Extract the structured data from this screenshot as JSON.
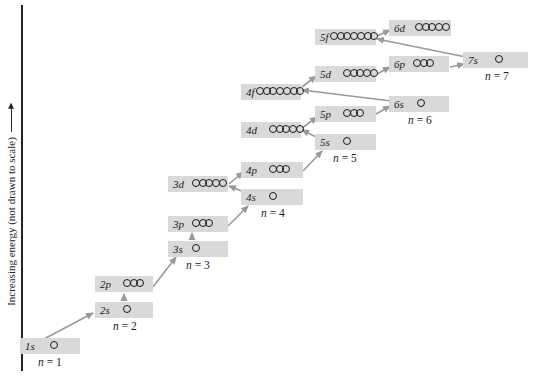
{
  "axis": {
    "label": "Increasing energy (not drawn to scale)"
  },
  "colors": {
    "box_fill": "#d9d9d9",
    "arrow": "#999999",
    "text": "#1a1a1a"
  },
  "subshells": [
    {
      "id": "1s",
      "label": "1s",
      "orbitals": 1,
      "x": 20,
      "y": 338,
      "w": 60,
      "orb_x": 30
    },
    {
      "id": "2s",
      "label": "2s",
      "orbitals": 1,
      "x": 95,
      "y": 302,
      "w": 58,
      "orb_x": 28
    },
    {
      "id": "2p",
      "label": "2p",
      "orbitals": 3,
      "x": 95,
      "y": 276,
      "w": 58,
      "orb_x": 28
    },
    {
      "id": "3s",
      "label": "3s",
      "orbitals": 1,
      "x": 168,
      "y": 241,
      "w": 60,
      "orb_x": 24
    },
    {
      "id": "3p",
      "label": "3p",
      "orbitals": 3,
      "x": 168,
      "y": 216,
      "w": 60,
      "orb_x": 24
    },
    {
      "id": "3d",
      "label": "3d",
      "orbitals": 5,
      "x": 168,
      "y": 176,
      "w": 60,
      "orb_x": 24
    },
    {
      "id": "4s",
      "label": "4s",
      "orbitals": 1,
      "x": 241,
      "y": 189,
      "w": 62,
      "orb_x": 28
    },
    {
      "id": "4p",
      "label": "4p",
      "orbitals": 3,
      "x": 241,
      "y": 162,
      "w": 62,
      "orb_x": 28
    },
    {
      "id": "4d",
      "label": "4d",
      "orbitals": 5,
      "x": 241,
      "y": 122,
      "w": 60,
      "orb_x": 28
    },
    {
      "id": "4f",
      "label": "4f",
      "orbitals": 7,
      "x": 241,
      "y": 84,
      "w": 60,
      "orb_x": 15
    },
    {
      "id": "5s",
      "label": "5s",
      "orbitals": 1,
      "x": 315,
      "y": 134,
      "w": 61,
      "orb_x": 28
    },
    {
      "id": "5p",
      "label": "5p",
      "orbitals": 3,
      "x": 315,
      "y": 106,
      "w": 61,
      "orb_x": 28
    },
    {
      "id": "5d",
      "label": "5d",
      "orbitals": 5,
      "x": 315,
      "y": 66,
      "w": 61,
      "orb_x": 28
    },
    {
      "id": "5f",
      "label": "5f",
      "orbitals": 7,
      "x": 315,
      "y": 29,
      "w": 61,
      "orb_x": 15
    },
    {
      "id": "6s",
      "label": "6s",
      "orbitals": 1,
      "x": 389,
      "y": 96,
      "w": 60,
      "orb_x": 28
    },
    {
      "id": "6p",
      "label": "6p",
      "orbitals": 3,
      "x": 389,
      "y": 56,
      "w": 60,
      "orb_x": 24
    },
    {
      "id": "6d",
      "label": "6d",
      "orbitals": 5,
      "x": 389,
      "y": 20,
      "w": 62,
      "orb_x": 26
    },
    {
      "id": "7s",
      "label": "7s",
      "orbitals": 1,
      "x": 463,
      "y": 52,
      "w": 65,
      "orb_x": 32
    }
  ],
  "shell_labels": [
    {
      "n": "n",
      "eq": " = 1",
      "x": 38,
      "y": 356
    },
    {
      "n": "n",
      "eq": " = 2",
      "x": 113,
      "y": 320
    },
    {
      "n": "n",
      "eq": " = 3",
      "x": 186,
      "y": 259
    },
    {
      "n": "n",
      "eq": " = 4",
      "x": 261,
      "y": 207
    },
    {
      "n": "n",
      "eq": " = 5",
      "x": 333,
      "y": 152
    },
    {
      "n": "n",
      "eq": " = 6",
      "x": 408,
      "y": 114
    },
    {
      "n": "n",
      "eq": " = 7",
      "x": 485,
      "y": 70
    }
  ],
  "filling_order": [
    "1s",
    "2s",
    "2p",
    "3s",
    "3p",
    "4s",
    "3d",
    "4p",
    "5s",
    "4d",
    "5p",
    "6s",
    "4f",
    "5d",
    "6p",
    "7s",
    "5f",
    "6d"
  ],
  "arrows": [
    {
      "from": "1s",
      "to": "2s",
      "x1": 44,
      "y1": 339,
      "x2": 93,
      "y2": 313
    },
    {
      "from": "2s",
      "to": "2p",
      "x1": 124,
      "y1": 301,
      "x2": 124,
      "y2": 294
    },
    {
      "from": "2p",
      "to": "3s",
      "x1": 153,
      "y1": 287,
      "x2": 176,
      "y2": 257
    },
    {
      "from": "3s",
      "to": "3p",
      "x1": 192,
      "y1": 240,
      "x2": 192,
      "y2": 233
    },
    {
      "from": "3p",
      "to": "4s",
      "x1": 228,
      "y1": 226,
      "x2": 248,
      "y2": 206
    },
    {
      "from": "4s",
      "to": "3d",
      "x1": 244,
      "y1": 192,
      "x2": 229,
      "y2": 186
    },
    {
      "from": "3d",
      "to": "4p",
      "x1": 229,
      "y1": 184,
      "x2": 243,
      "y2": 172
    },
    {
      "from": "4p",
      "to": "5s",
      "x1": 303,
      "y1": 171,
      "x2": 322,
      "y2": 151
    },
    {
      "from": "5s",
      "to": "4d",
      "x1": 318,
      "y1": 138,
      "x2": 302,
      "y2": 130
    },
    {
      "from": "4d",
      "to": "5p",
      "x1": 302,
      "y1": 128,
      "x2": 317,
      "y2": 117
    },
    {
      "from": "5p",
      "to": "6s",
      "x1": 376,
      "y1": 114,
      "x2": 390,
      "y2": 106
    },
    {
      "from": "6s",
      "to": "4f",
      "x1": 391,
      "y1": 101,
      "x2": 302,
      "y2": 90
    },
    {
      "from": "4f",
      "to": "5d",
      "x1": 302,
      "y1": 87,
      "x2": 316,
      "y2": 76
    },
    {
      "from": "5d",
      "to": "6p",
      "x1": 377,
      "y1": 74,
      "x2": 390,
      "y2": 67
    },
    {
      "from": "6p",
      "to": "7s",
      "x1": 450,
      "y1": 67,
      "x2": 464,
      "y2": 64
    },
    {
      "from": "7s",
      "to": "5f",
      "x1": 466,
      "y1": 57,
      "x2": 377,
      "y2": 39
    },
    {
      "from": "5f",
      "to": "6d",
      "x1": 377,
      "y1": 36,
      "x2": 390,
      "y2": 30
    }
  ]
}
